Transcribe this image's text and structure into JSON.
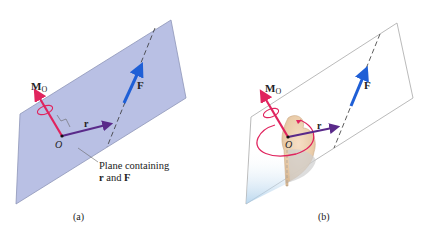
{
  "figures": [
    {
      "id": "a",
      "caption": "(a)",
      "vector_moment": "M",
      "moment_subscript": "O",
      "vector_position": "r",
      "vector_force": "F",
      "origin": "O",
      "plane_label_line1": "Plane containing",
      "plane_label_line2_r": "r",
      "plane_label_line2_and": " and ",
      "plane_label_line2_f": "F"
    },
    {
      "id": "b",
      "caption": "(b)",
      "vector_moment": "M",
      "moment_subscript": "O",
      "vector_position": "r",
      "vector_force": "F",
      "origin": "O"
    }
  ],
  "colors": {
    "plane_fill": "#b9c0e4",
    "plane_edge": "#8e95b8",
    "moment": "#e0245e",
    "position": "#5a2a8a",
    "force": "#1f5fd6",
    "text": "#222222"
  }
}
